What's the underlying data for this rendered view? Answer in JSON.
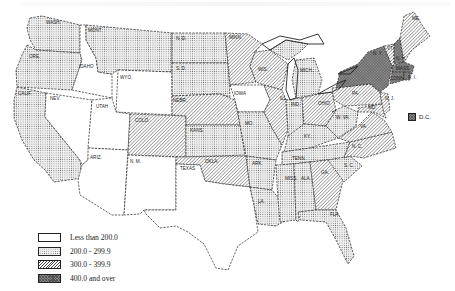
{
  "map": {
    "title": "",
    "classes": [
      {
        "id": "c1",
        "label": "Less than 200.0",
        "pattern": "blank",
        "color": "#ffffff"
      },
      {
        "id": "c2",
        "label": "200.0 - 299.9",
        "pattern": "stipple",
        "color": "#e8e8e8"
      },
      {
        "id": "c3",
        "label": "300.0 - 399.9",
        "pattern": "diagonal-hatch",
        "color": "#b0b0b0"
      },
      {
        "id": "c4",
        "label": "400.0 and over",
        "pattern": "cross-hatch",
        "color": "#7a7a7a"
      }
    ],
    "states": [
      {
        "abbr": "WASH.",
        "class": "c2"
      },
      {
        "abbr": "ORE.",
        "class": "c2"
      },
      {
        "abbr": "CALIF.",
        "class": "c2"
      },
      {
        "abbr": "IDAHO",
        "class": "c1"
      },
      {
        "abbr": "NEV.",
        "class": "c1"
      },
      {
        "abbr": "MONT.",
        "class": "c2"
      },
      {
        "abbr": "WYO.",
        "class": "c1"
      },
      {
        "abbr": "UTAH",
        "class": "c1"
      },
      {
        "abbr": "ARIZ.",
        "class": "c1"
      },
      {
        "abbr": "COLO.",
        "class": "c3"
      },
      {
        "abbr": "N. M.",
        "class": "c1"
      },
      {
        "abbr": "N. D.",
        "class": "c2"
      },
      {
        "abbr": "S. D.",
        "class": "c2"
      },
      {
        "abbr": "NEBR.",
        "class": "c3"
      },
      {
        "abbr": "KANS.",
        "class": "c2"
      },
      {
        "abbr": "OKLA.",
        "class": "c3"
      },
      {
        "abbr": "TEXAS",
        "class": "c1"
      },
      {
        "abbr": "MINN.",
        "class": "c3"
      },
      {
        "abbr": "IOWA",
        "class": "c1"
      },
      {
        "abbr": "MO.",
        "class": "c2"
      },
      {
        "abbr": "ARK.",
        "class": "c2"
      },
      {
        "abbr": "LA.",
        "class": "c2"
      },
      {
        "abbr": "WIS.",
        "class": "c3"
      },
      {
        "abbr": "ILL.",
        "class": "c3"
      },
      {
        "abbr": "MICH.",
        "class": "c2"
      },
      {
        "abbr": "IND.",
        "class": "c2"
      },
      {
        "abbr": "OHIO",
        "class": "c3"
      },
      {
        "abbr": "KY.",
        "class": "c2"
      },
      {
        "abbr": "TENN.",
        "class": "c2"
      },
      {
        "abbr": "MISS.",
        "class": "c2"
      },
      {
        "abbr": "ALA.",
        "class": "c2"
      },
      {
        "abbr": "GA.",
        "class": "c3"
      },
      {
        "abbr": "FLA.",
        "class": "c2"
      },
      {
        "abbr": "S. C.",
        "class": "c2"
      },
      {
        "abbr": "N. C.",
        "class": "c3"
      },
      {
        "abbr": "VA.",
        "class": "c3"
      },
      {
        "abbr": "W. VA.",
        "class": "c2"
      },
      {
        "abbr": "MD.",
        "class": "c3"
      },
      {
        "abbr": "DEL.",
        "class": "c3"
      },
      {
        "abbr": "PA.",
        "class": "c3"
      },
      {
        "abbr": "N. J.",
        "class": "c3"
      },
      {
        "abbr": "N. Y.",
        "class": "c4"
      },
      {
        "abbr": "VT.",
        "class": "c3"
      },
      {
        "abbr": "N. H.",
        "class": "c4"
      },
      {
        "abbr": "ME.",
        "class": "c3"
      },
      {
        "abbr": "MASS.",
        "class": "c4"
      },
      {
        "abbr": "R. I.",
        "class": "c4"
      },
      {
        "abbr": "CONN.",
        "class": "c4"
      },
      {
        "abbr": "D.C.",
        "class": "c4"
      }
    ],
    "inset_label": "D.C.",
    "labels": {
      "wash": "WASH.",
      "ore": "ORE.",
      "calif": "CALIF.",
      "idaho": "IDAHO",
      "nev": "NEV.",
      "mont": "MONT.",
      "wyo": "WYO.",
      "utah": "UTAH",
      "ariz": "ARIZ.",
      "colo": "COLO.",
      "nm": "N. M.",
      "nd": "N. D.",
      "sd": "S. D.",
      "nebr": "NEBR.",
      "kans": "KANS.",
      "okla": "OKLA.",
      "texas": "TEXAS",
      "minn": "MINN.",
      "iowa": "IOWA",
      "mo": "MO.",
      "ark": "ARK.",
      "la": "LA.",
      "wis": "WIS.",
      "ill": "ILL.",
      "mich": "MICH.",
      "ind": "IND.",
      "ohio": "OHIO",
      "ky": "KY.",
      "tenn": "TENN.",
      "miss": "MISS.",
      "ala": "ALA.",
      "ga": "GA.",
      "fla": "FLA.",
      "sc": "S. C.",
      "nc": "N. C.",
      "va": "VA.",
      "wva": "W. VA.",
      "md": "MD.",
      "pa": "PA.",
      "nj": "N. J.",
      "ny": "N. Y.",
      "vt": "VT.",
      "nh": "N. H.",
      "me": "ME.",
      "mass": "MASS.",
      "ri": "R. I.",
      "conn": "CONN.",
      "del": "DEL."
    }
  },
  "legend": {
    "items": [
      {
        "label": "Less than 200.0"
      },
      {
        "label": "200.0 - 299.9"
      },
      {
        "label": "300.0 - 399.9"
      },
      {
        "label": "400.0 and over"
      }
    ]
  }
}
